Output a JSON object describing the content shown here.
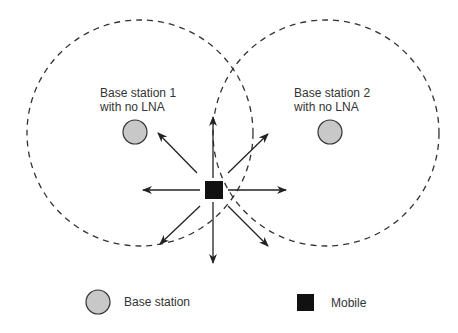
{
  "diagram": {
    "base_station_1": {
      "line1": "Base station 1",
      "line2": "with no LNA"
    },
    "base_station_2": {
      "line1": "Base station 2",
      "line2": "with no LNA"
    },
    "legend": {
      "base_station": "Base station",
      "mobile": "Mobile"
    },
    "colors": {
      "station_fill": "#c8c8c8",
      "mobile_fill": "#111111",
      "line": "#222222"
    }
  }
}
